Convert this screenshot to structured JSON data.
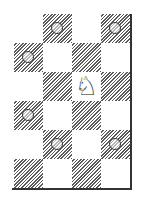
{
  "diagram": {
    "type": "chess-knight-moves",
    "columns": 4,
    "rows": 6,
    "square_size_px": 29,
    "colors": {
      "dark_hatch": "#5a5a5a",
      "light": "#ffffff",
      "border": "#333333"
    },
    "piece": {
      "name": "knight",
      "color": "white",
      "glyph": "♘",
      "row": 2,
      "col": 2
    },
    "squares": [
      {
        "row": 0,
        "col": 0,
        "dark": false,
        "marker": false
      },
      {
        "row": 0,
        "col": 1,
        "dark": true,
        "marker": true
      },
      {
        "row": 0,
        "col": 2,
        "dark": false,
        "marker": false
      },
      {
        "row": 0,
        "col": 3,
        "dark": true,
        "marker": true
      },
      {
        "row": 1,
        "col": 0,
        "dark": true,
        "marker": true
      },
      {
        "row": 1,
        "col": 1,
        "dark": false,
        "marker": false
      },
      {
        "row": 1,
        "col": 2,
        "dark": true,
        "marker": false
      },
      {
        "row": 1,
        "col": 3,
        "dark": false,
        "marker": false
      },
      {
        "row": 2,
        "col": 0,
        "dark": false,
        "marker": false
      },
      {
        "row": 2,
        "col": 1,
        "dark": true,
        "marker": false
      },
      {
        "row": 2,
        "col": 2,
        "dark": false,
        "marker": false
      },
      {
        "row": 2,
        "col": 3,
        "dark": true,
        "marker": false
      },
      {
        "row": 3,
        "col": 0,
        "dark": true,
        "marker": true
      },
      {
        "row": 3,
        "col": 1,
        "dark": false,
        "marker": false
      },
      {
        "row": 3,
        "col": 2,
        "dark": true,
        "marker": false
      },
      {
        "row": 3,
        "col": 3,
        "dark": false,
        "marker": false
      },
      {
        "row": 4,
        "col": 0,
        "dark": false,
        "marker": false
      },
      {
        "row": 4,
        "col": 1,
        "dark": true,
        "marker": true
      },
      {
        "row": 4,
        "col": 2,
        "dark": false,
        "marker": false
      },
      {
        "row": 4,
        "col": 3,
        "dark": true,
        "marker": true
      },
      {
        "row": 5,
        "col": 0,
        "dark": true,
        "marker": false
      },
      {
        "row": 5,
        "col": 1,
        "dark": false,
        "marker": false
      },
      {
        "row": 5,
        "col": 2,
        "dark": true,
        "marker": false
      },
      {
        "row": 5,
        "col": 3,
        "dark": false,
        "marker": false
      }
    ]
  }
}
